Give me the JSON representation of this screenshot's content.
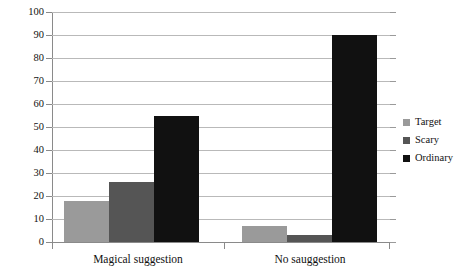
{
  "chart_data": {
    "type": "bar",
    "title": "",
    "subtitle": "",
    "xlabel": "",
    "ylabel": "",
    "categories": [
      "Magical suggestion",
      "No sauggestion"
    ],
    "series": [
      {
        "name": "Target",
        "color": "#9a9a9a",
        "values": [
          18,
          7
        ]
      },
      {
        "name": "Scary",
        "color": "#555555",
        "values": [
          26,
          3
        ]
      },
      {
        "name": "Ordinary",
        "color": "#111111",
        "values": [
          55,
          90
        ]
      }
    ],
    "ylim": [
      0,
      100
    ],
    "ytick_step": 10,
    "yticks": [
      "100",
      "90",
      "80",
      "70",
      "60",
      "50",
      "40",
      "30",
      "20",
      "10",
      "0"
    ],
    "grid": true,
    "grid_axis": "y",
    "legend_position": "right",
    "bar_group_gap": true
  },
  "axes": {
    "y_tick_labels": [
      "100",
      "90",
      "80",
      "70",
      "60",
      "50",
      "40",
      "30",
      "20",
      "10",
      "0"
    ],
    "x_tick_labels": [
      "Magical suggestion",
      "No sauggestion"
    ]
  },
  "legend": {
    "items": [
      {
        "label": "Target",
        "color": "#9a9a9a"
      },
      {
        "label": "Scary",
        "color": "#555555"
      },
      {
        "label": "Ordinary",
        "color": "#111111"
      }
    ]
  },
  "colors": {
    "target": "#9a9a9a",
    "scary": "#555555",
    "ordinary": "#111111",
    "gridline": "#b9b9b9",
    "axis": "#8a8a8a",
    "background": "#ffffff",
    "text": "#111111"
  }
}
